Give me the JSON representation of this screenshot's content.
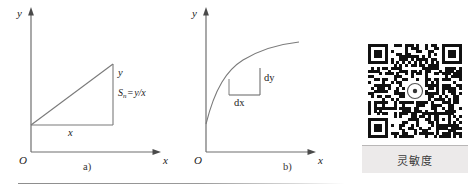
{
  "figure": {
    "background": "#ffffff",
    "stroke_color": "#6f6f6f",
    "rule_color": "#8d8d8d"
  },
  "panel_a": {
    "caption": "a)",
    "y_axis_label": "y",
    "x_axis_label": "x",
    "origin_label": "O",
    "vertical_side_label": "y",
    "horizontal_side_label": "x",
    "formula": {
      "symbol": "S",
      "subscript": "n",
      "operator": "=",
      "expression": "y/x",
      "full_text": "Sn = y/x"
    },
    "description": "linear characteristic: straight line through origin with right triangle showing rise y over run x"
  },
  "panel_b": {
    "caption": "b)",
    "y_axis_label": "y",
    "x_axis_label": "x",
    "origin_label": "O",
    "vertical_side_label": "dy",
    "horizontal_side_label": "dx",
    "description": "nonlinear characteristic: concave curve with tangent triangle dy over dx"
  },
  "qr": {
    "caption": "灵敏度",
    "caption_box_color": "#eceaea",
    "module_color": "#111111",
    "modules": 33
  },
  "chart_data": {
    "type": "line",
    "title": "",
    "panels": [
      {
        "id": "a",
        "label": "a)",
        "xlabel": "x",
        "ylabel": "y",
        "series": [
          {
            "name": "linear-characteristic",
            "x": [
              0,
              1
            ],
            "y": [
              0,
              1
            ]
          }
        ],
        "annotations": [
          "y",
          "x",
          "Sn = y/x",
          "O"
        ]
      },
      {
        "id": "b",
        "label": "b)",
        "xlabel": "x",
        "ylabel": "y",
        "series": [
          {
            "name": "nonlinear-characteristic",
            "x": [
              0.0,
              0.1,
              0.25,
              0.45,
              0.65,
              0.85,
              1.0
            ],
            "y": [
              0.0,
              0.38,
              0.6,
              0.76,
              0.86,
              0.93,
              0.97
            ]
          }
        ],
        "annotations": [
          "dy",
          "dx",
          "O"
        ]
      }
    ],
    "grid": false,
    "legend": "none"
  }
}
